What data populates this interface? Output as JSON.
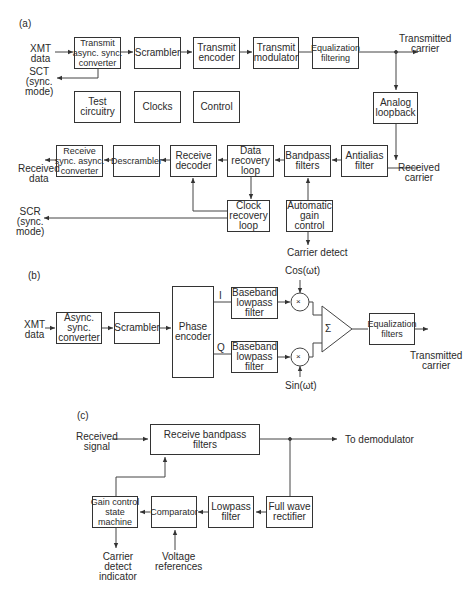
{
  "section_a": {
    "label": "(a)",
    "blocks": {
      "tx_converter": "Transmit\nasync. sync.\nconverter",
      "scrambler": "Scrambler",
      "tx_encoder": "Transmit\nencoder",
      "tx_modulator": "Transmit\nmodulator",
      "equalization": "Equalization\nfiltering",
      "test": "Test\ncircuitry",
      "clocks": "Clocks",
      "control": "Control",
      "analog_loopback": "Analog\nloopback",
      "rx_converter": "Receive\nsync. async.\nconverter",
      "descrambler": "Descrambler",
      "rx_decoder": "Receive\ndecoder",
      "data_recovery": "Data\nrecovery\nloop",
      "bandpass": "Bandpass\nfilters",
      "antialias": "Antialias\nfilter",
      "clock_recovery": "Clock\nrecovery\nloop",
      "agc": "Automatic\ngain\ncontrol"
    },
    "labels": {
      "xmt_data": "XMT\ndata",
      "sct": "SCT\n(sync.\nmode)",
      "transmitted_carrier": "Transmitted\ncarrier",
      "received_carrier": "Received\ncarrier",
      "received_data": "Received\ndata",
      "scr": "SCR\n(sync.\nmode)",
      "carrier_detect": "Carrier detect"
    }
  },
  "section_b": {
    "label": "(b)",
    "blocks": {
      "converter": "Async.\nsync.\nconverter",
      "scrambler": "Scrambler",
      "phase_encoder": "Phase\nencoder",
      "lpf_i": "Baseband\nlowpass\nfilter",
      "lpf_q": "Baseband\nlowpass\nfilter",
      "summer": "Σ",
      "equalization": "Equalization\nfilters"
    },
    "labels": {
      "xmt_data": "XMT\ndata",
      "i": "I",
      "q": "Q",
      "cos": "Cos(ωt)",
      "sin": "Sin(ωt)",
      "mult": "×",
      "transmitted_carrier": "Transmitted\ncarrier"
    }
  },
  "section_c": {
    "label": "(c)",
    "blocks": {
      "rx_bandpass": "Receive bandpass filters",
      "gain_control": "Gain control\nstate\nmachine",
      "comparator": "Comparator",
      "lowpass": "Lowpass\nfilter",
      "rectifier": "Full wave\nrectifier"
    },
    "labels": {
      "received_signal": "Received\nsignal",
      "to_demodulator": "To demodulator",
      "carrier_detect_indicator": "Carrier\ndetect\nindicator",
      "voltage_references": "Voltage\nreferences"
    }
  }
}
